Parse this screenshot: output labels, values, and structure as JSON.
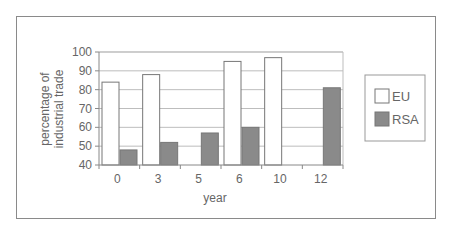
{
  "chart_data": {
    "type": "bar",
    "title": "",
    "xlabel": "year",
    "ylabel": "percentage of industrial trade",
    "ylabel_lines": [
      "percentage of",
      "industrial trade"
    ],
    "ylim": [
      40,
      100
    ],
    "yticks": [
      40,
      50,
      60,
      70,
      80,
      90,
      100
    ],
    "grid": true,
    "legend_position": "right",
    "categories": [
      "0",
      "3",
      "5",
      "6",
      "10",
      "12"
    ],
    "series": [
      {
        "name": "EU",
        "color": "#ffffff",
        "values": [
          84,
          88,
          null,
          95,
          97,
          null
        ]
      },
      {
        "name": "RSA",
        "color": "#8a8a8a",
        "values": [
          48,
          52,
          57,
          60,
          null,
          81
        ]
      }
    ]
  }
}
